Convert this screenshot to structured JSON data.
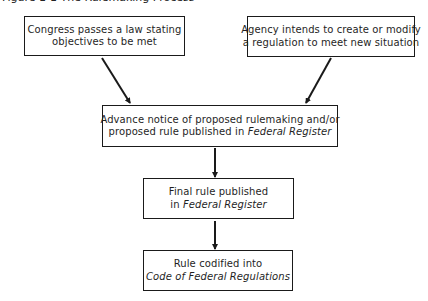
{
  "caption": "Figure 1-1  The Rulemaking Process",
  "boxes": {
    "congress": {
      "line1": "Congress passes a law stating",
      "line2": "objectives to be met"
    },
    "agency": {
      "line1": "Agency intends to create or modify",
      "line2": "a regulation to meet new situation"
    },
    "proposed": {
      "line1": "Advance notice of proposed rulemaking and/or",
      "line2_prefix": "proposed rule published in ",
      "line2_italic": "Federal Register"
    },
    "final": {
      "line1": "Final rule published",
      "line2_prefix": "in ",
      "line2_italic": "Federal Register"
    },
    "codified": {
      "line1": "Rule codified into",
      "line2_italic": "Code of Federal Regulations"
    }
  },
  "arrows": [
    {
      "from": "congress",
      "to": "proposed"
    },
    {
      "from": "agency",
      "to": "proposed"
    },
    {
      "from": "proposed",
      "to": "final"
    },
    {
      "from": "final",
      "to": "codified"
    }
  ],
  "colors": {
    "stroke": "#1a1a1a",
    "background": "#ffffff"
  }
}
